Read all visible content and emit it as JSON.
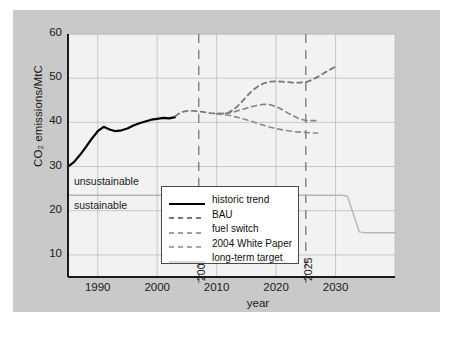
{
  "figure": {
    "background_color": "#ffffff",
    "panel_color": "#c9c9c9",
    "plot_color": "#f2f2f2",
    "axis_color": "#1a1a1a",
    "grid_color": "#bdbdbd",
    "historic_color": "#000000",
    "scenario_color": "#808080",
    "target_color": "#b0b0b0"
  },
  "chart_data": {
    "type": "line",
    "title": "",
    "xlabel": "year",
    "ylabel": "CO₂ emissions/MtC",
    "xlim": [
      1985,
      2040
    ],
    "ylim": [
      5,
      60
    ],
    "xticks": [
      1990,
      2000,
      2010,
      2020,
      2030
    ],
    "xticklabels": [
      "1990",
      "2000",
      "2010",
      "2020",
      "2030"
    ],
    "yticks": [
      10,
      20,
      30,
      40,
      50,
      60
    ],
    "yticklabels": [
      "10",
      "20",
      "30",
      "40",
      "50",
      "60"
    ],
    "grid": true,
    "legend_position": "lower center",
    "marker_lines": [
      {
        "label": "2007",
        "x": 2007
      },
      {
        "label": "2025",
        "x": 2025
      }
    ],
    "annotations": [
      {
        "text": "unsustainable",
        "x": 1986,
        "y": 26.5
      },
      {
        "text": "sustainable",
        "x": 1986,
        "y": 21.0
      }
    ],
    "series": [
      {
        "name": "historic trend",
        "style": "solid",
        "color": "#000000",
        "width": 2.2,
        "points": [
          [
            1985,
            30.0
          ],
          [
            1986,
            31.0
          ],
          [
            1987,
            32.6
          ],
          [
            1988,
            34.4
          ],
          [
            1989,
            36.3
          ],
          [
            1990,
            38.0
          ],
          [
            1991,
            39.0
          ],
          [
            1992,
            38.4
          ],
          [
            1993,
            38.0
          ],
          [
            1994,
            38.2
          ],
          [
            1995,
            38.6
          ],
          [
            1996,
            39.3
          ],
          [
            1997,
            39.8
          ],
          [
            1998,
            40.2
          ],
          [
            1999,
            40.6
          ],
          [
            2000,
            40.8
          ],
          [
            2001,
            41.0
          ],
          [
            2002,
            40.9
          ],
          [
            2003,
            41.2
          ]
        ]
      },
      {
        "name": "BAU",
        "style": "dashed",
        "color": "#787878",
        "width": 1.8,
        "points": [
          [
            2003,
            41.4
          ],
          [
            2004,
            42.3
          ],
          [
            2005,
            42.6
          ],
          [
            2006,
            42.6
          ],
          [
            2007,
            42.5
          ],
          [
            2008,
            42.3
          ],
          [
            2009,
            42.1
          ],
          [
            2010,
            42.0
          ],
          [
            2011,
            42.0
          ],
          [
            2012,
            42.2
          ],
          [
            2013,
            43.0
          ],
          [
            2014,
            44.3
          ],
          [
            2015,
            45.8
          ],
          [
            2016,
            47.2
          ],
          [
            2017,
            48.2
          ],
          [
            2018,
            48.9
          ],
          [
            2019,
            49.2
          ],
          [
            2020,
            49.3
          ],
          [
            2021,
            49.2
          ],
          [
            2022,
            49.1
          ],
          [
            2023,
            49.0
          ],
          [
            2024,
            49.0
          ],
          [
            2025,
            49.1
          ],
          [
            2026,
            49.6
          ],
          [
            2027,
            50.3
          ],
          [
            2028,
            51.1
          ],
          [
            2029,
            51.9
          ],
          [
            2030,
            52.6
          ]
        ]
      },
      {
        "name": "fuel switch",
        "style": "dashed",
        "color": "#808080",
        "width": 1.6,
        "points": [
          [
            2010,
            42.0
          ],
          [
            2011,
            42.0
          ],
          [
            2012,
            42.1
          ],
          [
            2013,
            42.4
          ],
          [
            2014,
            42.8
          ],
          [
            2015,
            43.2
          ],
          [
            2016,
            43.6
          ],
          [
            2017,
            43.9
          ],
          [
            2018,
            44.1
          ],
          [
            2019,
            44.0
          ],
          [
            2020,
            43.6
          ],
          [
            2021,
            42.9
          ],
          [
            2022,
            42.1
          ],
          [
            2023,
            41.4
          ],
          [
            2024,
            40.8
          ],
          [
            2025,
            40.4
          ],
          [
            2026,
            40.4
          ],
          [
            2027,
            40.4
          ]
        ]
      },
      {
        "name": "2004 White Paper",
        "style": "dashed",
        "color": "#8a8a8a",
        "width": 1.6,
        "points": [
          [
            2010,
            41.9
          ],
          [
            2011,
            41.8
          ],
          [
            2012,
            41.6
          ],
          [
            2013,
            41.3
          ],
          [
            2014,
            41.0
          ],
          [
            2015,
            40.6
          ],
          [
            2016,
            40.2
          ],
          [
            2017,
            39.7
          ],
          [
            2018,
            39.3
          ],
          [
            2019,
            38.9
          ],
          [
            2020,
            38.6
          ],
          [
            2021,
            38.3
          ],
          [
            2022,
            38.1
          ],
          [
            2023,
            37.9
          ],
          [
            2024,
            37.8
          ],
          [
            2025,
            37.7
          ],
          [
            2026,
            37.6
          ],
          [
            2027,
            37.6
          ]
        ]
      },
      {
        "name": "long-term target",
        "style": "solid",
        "color": "#b5b5b5",
        "width": 1.4,
        "points": [
          [
            1985,
            23.5
          ],
          [
            2031,
            23.5
          ],
          [
            2032,
            23.3
          ],
          [
            2034,
            15.2
          ],
          [
            2035,
            15.0
          ],
          [
            2040,
            15.0
          ]
        ]
      }
    ]
  },
  "legend": {
    "items": [
      {
        "label": "historic trend",
        "style": "solid",
        "color": "#000000",
        "width": 2.2
      },
      {
        "label": "BAU",
        "style": "dashed",
        "color": "#787878",
        "width": 1.8
      },
      {
        "label": "fuel switch",
        "style": "dashed",
        "color": "#808080",
        "width": 1.6
      },
      {
        "label": "2004 White Paper",
        "style": "dashed",
        "color": "#8a8a8a",
        "width": 1.6
      },
      {
        "label": "long-term target",
        "style": "solid",
        "color": "#b5b5b5",
        "width": 1.2
      }
    ]
  },
  "caption": {
    "text": ""
  }
}
